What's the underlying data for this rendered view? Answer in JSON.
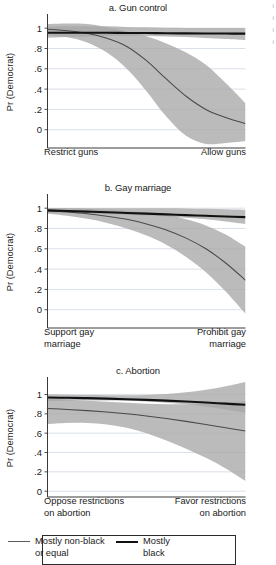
{
  "figure": {
    "y_axis_title": "Pr (Democrat)",
    "y_ticks": [
      "1",
      ".8",
      ".6",
      ".4",
      ".2",
      "0"
    ],
    "y_tick_values": [
      1,
      0.8,
      0.6,
      0.4,
      0.2,
      0
    ]
  },
  "panels": {
    "a": {
      "title": "a. Gun control",
      "x_label_left": "Restrict guns",
      "x_label_right": "Allow guns"
    },
    "b": {
      "title": "b. Gay marriage",
      "x_label_left": "Support gay\nmarriage",
      "x_label_right": "Prohibit gay\nmarriage"
    },
    "c": {
      "title": "c. Abortion",
      "x_label_left": "Oppose restrictions\non abortion",
      "x_label_right": "Favor restrictions\non abortion"
    }
  },
  "legend": {
    "items": [
      {
        "label": "Mostly non-black\nor equal",
        "style": "thin",
        "color": "#5a5a5a"
      },
      {
        "label": "Mostly\nblack",
        "style": "thick",
        "color": "#111111"
      }
    ]
  },
  "colors": {
    "band": "#a8a8a8",
    "line_nonblack": "#4a4a4a",
    "line_black": "#111111",
    "gridline": "#b9c6d4",
    "axis": "#3a3a3a"
  },
  "chart_data": [
    {
      "type": "line",
      "id": "a",
      "title": "a. Gun control",
      "xlabel": "Restrict guns → Allow guns",
      "ylabel": "Pr (Democrat)",
      "ylim": [
        -0.18,
        1.12
      ],
      "xlim": [
        0,
        1
      ],
      "grid": true,
      "yticks": [
        0,
        0.2,
        0.4,
        0.6,
        0.8,
        1
      ],
      "x": [
        0,
        0.1,
        0.2,
        0.3,
        0.4,
        0.5,
        0.6,
        0.7,
        0.8,
        0.9,
        1
      ],
      "series": [
        {
          "name": "Mostly non-black or equal",
          "values": [
            0.99,
            0.975,
            0.95,
            0.9,
            0.82,
            0.68,
            0.5,
            0.33,
            0.2,
            0.12,
            0.06
          ],
          "ci_lower": [
            0.93,
            0.91,
            0.86,
            0.76,
            0.6,
            0.38,
            0.13,
            -0.06,
            -0.14,
            -0.13,
            -0.11
          ],
          "ci_upper": [
            1.04,
            1.045,
            1.04,
            1.01,
            0.97,
            0.92,
            0.85,
            0.76,
            0.64,
            0.46,
            0.26
          ]
        },
        {
          "name": "Mostly black",
          "values": [
            0.955,
            0.955,
            0.955,
            0.955,
            0.953,
            0.952,
            0.95,
            0.949,
            0.948,
            0.947,
            0.946
          ],
          "ci_lower": [
            0.905,
            0.912,
            0.918,
            0.922,
            0.925,
            0.922,
            0.918,
            0.912,
            0.903,
            0.893,
            0.882
          ],
          "ci_upper": [
            1.015,
            1.018,
            1.02,
            1.018,
            1.012,
            1.008,
            1.005,
            1.003,
            1.002,
            1.001,
            1.0
          ]
        }
      ]
    },
    {
      "type": "line",
      "id": "b",
      "title": "b. Gay marriage",
      "xlabel": "Support gay marriage → Prohibit gay marriage",
      "ylabel": "Pr (Democrat)",
      "ylim": [
        -0.18,
        1.12
      ],
      "xlim": [
        0,
        1
      ],
      "grid": true,
      "yticks": [
        0,
        0.2,
        0.4,
        0.6,
        0.8,
        1
      ],
      "x": [
        0,
        0.1,
        0.2,
        0.3,
        0.4,
        0.5,
        0.6,
        0.7,
        0.8,
        0.9,
        1
      ],
      "series": [
        {
          "name": "Mostly non-black or equal",
          "values": [
            0.975,
            0.962,
            0.945,
            0.92,
            0.89,
            0.845,
            0.785,
            0.705,
            0.6,
            0.46,
            0.29
          ],
          "ci_lower": [
            0.945,
            0.925,
            0.895,
            0.855,
            0.8,
            0.73,
            0.64,
            0.52,
            0.37,
            0.18,
            -0.04
          ],
          "ci_upper": [
            1.0,
            1.0,
            0.995,
            0.985,
            0.975,
            0.96,
            0.935,
            0.89,
            0.83,
            0.74,
            0.62
          ]
        },
        {
          "name": "Mostly black",
          "values": [
            0.978,
            0.972,
            0.966,
            0.96,
            0.953,
            0.946,
            0.939,
            0.932,
            0.925,
            0.918,
            0.912
          ],
          "ci_lower": [
            0.955,
            0.952,
            0.948,
            0.943,
            0.936,
            0.928,
            0.918,
            0.905,
            0.89,
            0.87,
            0.845
          ],
          "ci_upper": [
            1.0,
            1.0,
            1.0,
            1.0,
            1.0,
            1.0,
            1.0,
            0.998,
            0.995,
            0.99,
            0.985
          ]
        }
      ]
    },
    {
      "type": "line",
      "id": "c",
      "title": "c. Abortion",
      "xlabel": "Oppose restrictions on abortion → Favor restrictions on abortion",
      "ylabel": "Pr (Democrat)",
      "ylim": [
        -0.06,
        1.16
      ],
      "xlim": [
        0,
        1
      ],
      "grid": true,
      "yticks": [
        0,
        0.2,
        0.4,
        0.6,
        0.8,
        1
      ],
      "x": [
        0,
        0.1,
        0.2,
        0.3,
        0.4,
        0.5,
        0.6,
        0.7,
        0.8,
        0.9,
        1
      ],
      "series": [
        {
          "name": "Mostly non-black or equal",
          "values": [
            0.855,
            0.845,
            0.833,
            0.818,
            0.8,
            0.778,
            0.752,
            0.722,
            0.69,
            0.655,
            0.622
          ],
          "ci_lower": [
            0.695,
            0.705,
            0.705,
            0.69,
            0.655,
            0.6,
            0.525,
            0.44,
            0.345,
            0.235,
            0.105
          ],
          "ci_upper": [
            0.955,
            0.945,
            0.935,
            0.925,
            0.915,
            0.905,
            0.9,
            0.9,
            0.905,
            0.915,
            0.93
          ]
        },
        {
          "name": "Mostly black",
          "values": [
            0.968,
            0.966,
            0.962,
            0.957,
            0.951,
            0.944,
            0.936,
            0.927,
            0.917,
            0.905,
            0.893
          ],
          "ci_lower": [
            0.93,
            0.935,
            0.938,
            0.938,
            0.935,
            0.928,
            0.915,
            0.898,
            0.875,
            0.845,
            0.81
          ],
          "ci_upper": [
            1.0,
            0.998,
            0.995,
            0.993,
            0.992,
            0.995,
            1.005,
            1.022,
            1.048,
            1.085,
            1.13
          ]
        }
      ]
    }
  ]
}
